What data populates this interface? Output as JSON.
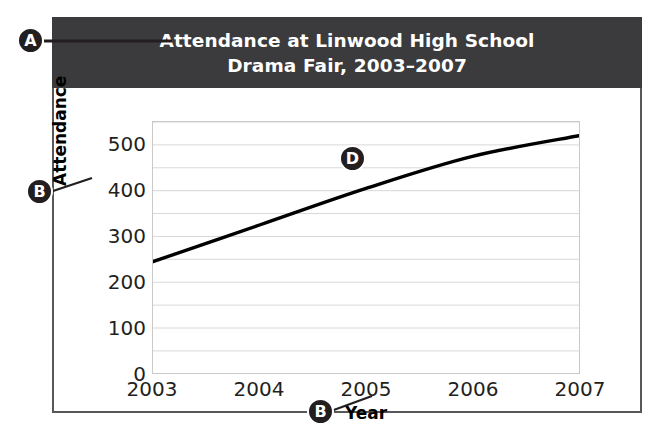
{
  "figure": {
    "title_line1": "Attendance at Linwood High School",
    "title_line2": "Drama Fair, 2003–2007",
    "band_color": "#3b3b3d",
    "frame_color": "#58585a"
  },
  "callouts": [
    {
      "id": "A",
      "label": "A",
      "target": "chart-title"
    },
    {
      "id": "B1",
      "label": "B",
      "target": "y-axis-title"
    },
    {
      "id": "B2",
      "label": "B",
      "target": "x-axis-title"
    },
    {
      "id": "D",
      "label": "D",
      "target": "data-line"
    }
  ],
  "chart_data": {
    "type": "line",
    "title": "Attendance at Linwood High School Drama Fair, 2003–2007",
    "xlabel": "Year",
    "ylabel": "Attendance",
    "categories": [
      "2003",
      "2004",
      "2005",
      "2006",
      "2007"
    ],
    "x": [
      2003,
      2004,
      2005,
      2006,
      2007
    ],
    "values": [
      245,
      325,
      405,
      475,
      520
    ],
    "series": [
      {
        "name": "Attendance",
        "values": [
          245,
          325,
          405,
          475,
          520
        ],
        "color": "#000000"
      }
    ],
    "ylim": [
      0,
      550
    ],
    "xlim": [
      2003,
      2007
    ],
    "yticks": [
      0,
      100,
      200,
      300,
      400,
      500
    ],
    "ytick_labels": [
      "0",
      "100",
      "200",
      "300",
      "400",
      "500"
    ],
    "xtick_labels": [
      "2003",
      "2004",
      "2005",
      "2006",
      "2007"
    ],
    "minor_gridline_step": 50,
    "grid": true,
    "grid_color": "#d8d8d8",
    "legend": false,
    "legend_position": "none"
  }
}
